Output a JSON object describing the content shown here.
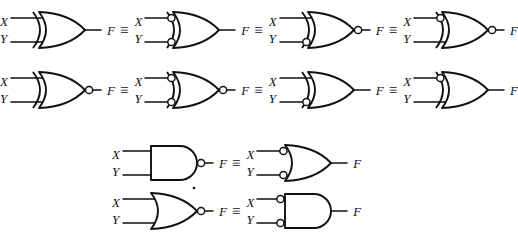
{
  "figure": {
    "equiv_symbol": "≡",
    "input_labels": {
      "x": "X",
      "y": "Y"
    },
    "output_label": "F",
    "ink_color": "#111111",
    "background_color": "#ffffff"
  },
  "rows": [
    {
      "id": "row-1",
      "gates": [
        {
          "name": "xor-gate",
          "type": "xor",
          "inputs": [
            "X",
            "Y"
          ],
          "output": "F",
          "input_bubbles": [
            false,
            false
          ],
          "output_bubble": false
        },
        {
          "name": "xor-gate-both-inputs-inverted",
          "type": "xor",
          "inputs": [
            "X",
            "Y"
          ],
          "output": "F",
          "input_bubbles": [
            true,
            true
          ],
          "output_bubble": false
        },
        {
          "name": "xor-gate-y-inverted-output-inverted",
          "type": "xor",
          "inputs": [
            "X",
            "Y"
          ],
          "output": "F",
          "input_bubbles": [
            false,
            true
          ],
          "output_bubble": true
        },
        {
          "name": "xor-gate-x-inverted-output-inverted",
          "type": "xor",
          "inputs": [
            "X",
            "Y"
          ],
          "output": "F",
          "input_bubbles": [
            true,
            false
          ],
          "output_bubble": true
        }
      ]
    },
    {
      "id": "row-2",
      "gates": [
        {
          "name": "xnor-gate",
          "type": "xor",
          "inputs": [
            "X",
            "Y"
          ],
          "output": "F",
          "input_bubbles": [
            false,
            false
          ],
          "output_bubble": true
        },
        {
          "name": "xor-gate-both-inputs-inverted-output-inverted",
          "type": "xor",
          "inputs": [
            "X",
            "Y"
          ],
          "output": "F",
          "input_bubbles": [
            true,
            true
          ],
          "output_bubble": true
        },
        {
          "name": "xor-gate-y-inverted",
          "type": "xor",
          "inputs": [
            "X",
            "Y"
          ],
          "output": "F",
          "input_bubbles": [
            false,
            true
          ],
          "output_bubble": false
        },
        {
          "name": "xor-gate-x-inverted",
          "type": "xor",
          "inputs": [
            "X",
            "Y"
          ],
          "output": "F",
          "input_bubbles": [
            true,
            false
          ],
          "output_bubble": false
        }
      ]
    },
    {
      "id": "row-3",
      "gates": [
        {
          "name": "nand-gate",
          "type": "and",
          "inputs": [
            "X",
            "Y"
          ],
          "output": "F",
          "input_bubbles": [
            false,
            false
          ],
          "output_bubble": true
        },
        {
          "name": "or-gate-both-inputs-inverted",
          "type": "or",
          "inputs": [
            "X",
            "Y"
          ],
          "output": "F",
          "input_bubbles": [
            true,
            true
          ],
          "output_bubble": false
        }
      ]
    },
    {
      "id": "row-4",
      "gates": [
        {
          "name": "nor-gate",
          "type": "or",
          "inputs": [
            "X",
            "Y"
          ],
          "output": "F",
          "input_bubbles": [
            false,
            false
          ],
          "output_bubble": true
        },
        {
          "name": "and-gate-both-inputs-inverted",
          "type": "and",
          "inputs": [
            "X",
            "Y"
          ],
          "output": "F",
          "input_bubbles": [
            true,
            true
          ],
          "output_bubble": false
        }
      ]
    }
  ]
}
